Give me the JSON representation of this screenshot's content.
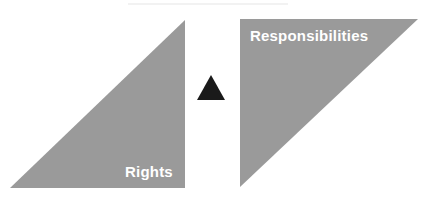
{
  "diagram": {
    "left_triangle": {
      "label": "Rights",
      "fill": "#9a9a9a",
      "points": "10,188 185,20 185,188"
    },
    "right_triangle": {
      "label": "Responsibilities",
      "fill": "#9a9a9a",
      "points": "240,19 418,19 240,187"
    },
    "center_marker": {
      "shape": "up-triangle",
      "fill": "#1a1a1a",
      "points": "197,100 211,75 225,100"
    }
  }
}
